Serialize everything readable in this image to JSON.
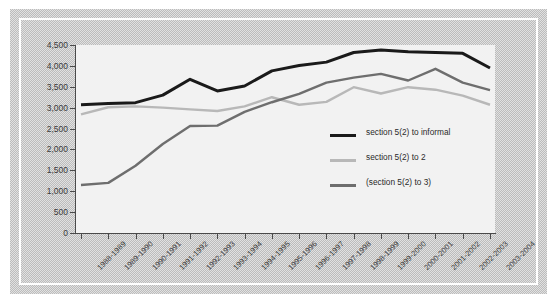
{
  "chart_data": {
    "type": "line",
    "title": "",
    "subtitle": "",
    "xlabel": "",
    "ylabel": "",
    "grid": false,
    "legend_position": "inside-center-right",
    "ylim": [
      0,
      4500
    ],
    "ytick_labels": [
      "4,500",
      "4,000",
      "3,500",
      "3,000",
      "2,500",
      "2,000",
      "1,500",
      "1,000",
      "500",
      "0"
    ],
    "ytick_values": [
      4500,
      4000,
      3500,
      3000,
      2500,
      2000,
      1500,
      1000,
      500,
      0
    ],
    "categories": [
      "1988-1989",
      "1989-1990",
      "1990-1991",
      "1991-1992",
      "1992-1993",
      "1993-1994",
      "1994-1995",
      "1995-1996",
      "1996-1997",
      "1997-1998",
      "1998-1999",
      "1999-2000",
      "2000-2001",
      "2001-2002",
      "2002-2003",
      "2003-2004"
    ],
    "series": [
      {
        "name": "section 5(2) to informal",
        "color": "#1a1a1a",
        "values": [
          3070,
          3100,
          3120,
          3300,
          3680,
          3400,
          3520,
          3880,
          4010,
          4090,
          4320,
          4380,
          4340,
          4320,
          4300,
          3950
        ]
      },
      {
        "name": "section 5(2) to  2",
        "color": "#b8b8b8",
        "values": [
          2840,
          3010,
          3030,
          3000,
          2960,
          2920,
          3030,
          3250,
          3070,
          3140,
          3490,
          3340,
          3490,
          3430,
          3290,
          3070
        ]
      },
      {
        "name": "(section 5(2) to 3)",
        "color": "#6e6e6e",
        "values": [
          1150,
          1200,
          1610,
          2130,
          2560,
          2570,
          2900,
          3130,
          3330,
          3600,
          3720,
          3810,
          3650,
          3930,
          3600,
          3420
        ]
      }
    ]
  },
  "legend": {
    "items": [
      {
        "label": "section 5(2) to informal",
        "color": "#1a1a1a"
      },
      {
        "label": "section 5(2) to  2",
        "color": "#b8b8b8"
      },
      {
        "label": "(section 5(2) to 3)",
        "color": "#6e6e6e"
      }
    ]
  },
  "colors": {
    "panel_background": "#f2f2f2",
    "frame_band": "#bcbcbc",
    "frame_rule": "#ffffff",
    "axis": "#4a4a4a",
    "tick_text": "#3a3a3a"
  }
}
